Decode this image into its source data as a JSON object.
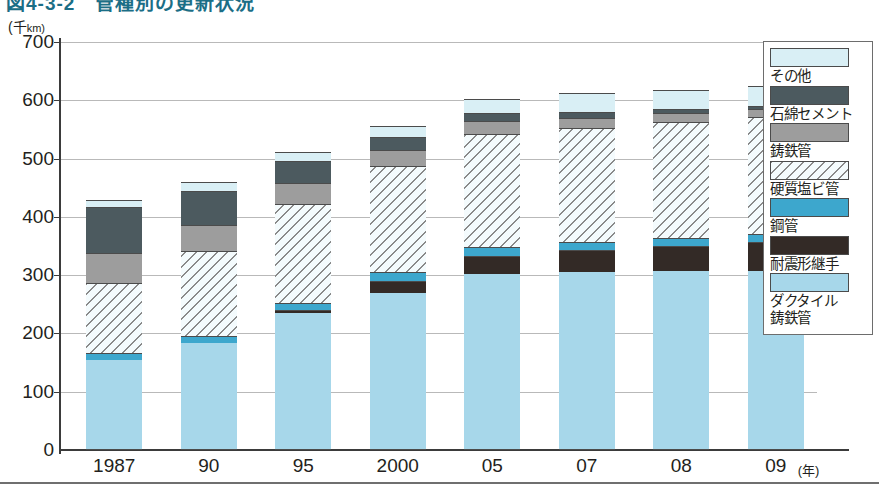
{
  "figure": {
    "title": "図4-3-2　管種別の更新状況",
    "unit_label": "(千km)",
    "unit_main": "(千",
    "unit_small": "km)",
    "x_unit": "(年)"
  },
  "chart_data": {
    "type": "bar",
    "stacked": true,
    "title": "図4-3-2　管種別の更新状況",
    "xlabel": "(年)",
    "ylabel": "(千km)",
    "ylim": [
      0,
      700
    ],
    "yticks": [
      0,
      100,
      200,
      300,
      400,
      500,
      600,
      700
    ],
    "grid": true,
    "legend_position": "right",
    "categories": [
      "1987",
      "90",
      "95",
      "2000",
      "05",
      "07",
      "08",
      "09"
    ],
    "series": [
      {
        "name": "ダクタイル鋳鉄管",
        "color": "#a7d7ea",
        "pattern": "solid",
        "values": [
          152,
          182,
          233,
          268,
          300,
          303,
          305,
          305
        ]
      },
      {
        "name": "耐震形継手",
        "color": "#332a26",
        "pattern": "solid",
        "values": [
          0,
          0,
          5,
          21,
          32,
          38,
          43,
          50
        ]
      },
      {
        "name": "鋼管",
        "color": "#3da7cd",
        "pattern": "solid",
        "values": [
          13,
          12,
          13,
          15,
          14,
          14,
          14,
          14
        ]
      },
      {
        "name": "硬質塩ビ管",
        "color": "#f4fbfd",
        "pattern": "diagonal-hatch",
        "values": [
          120,
          145,
          169,
          181,
          195,
          196,
          199,
          201
        ]
      },
      {
        "name": "鋳鉄管",
        "color": "#9d9d9d",
        "pattern": "solid",
        "values": [
          52,
          46,
          37,
          28,
          22,
          17,
          15,
          13
        ]
      },
      {
        "name": "石綿セメント",
        "color": "#4c5a5f",
        "pattern": "solid",
        "values": [
          78,
          57,
          37,
          22,
          14,
          10,
          8,
          6
        ]
      },
      {
        "name": "その他",
        "color": "#d9eff5",
        "pattern": "solid",
        "values": [
          13,
          16,
          15,
          19,
          23,
          33,
          32,
          33
        ]
      }
    ],
    "totals": [
      428,
      458,
      509,
      554,
      600,
      611,
      616,
      622
    ]
  },
  "yaxis": {
    "ticks": [
      "700",
      "600",
      "500",
      "400",
      "300",
      "200",
      "100",
      "0"
    ]
  },
  "xaxis": {
    "labels": [
      "1987",
      "90",
      "95",
      "2000",
      "05",
      "07",
      "08",
      "09"
    ],
    "unit": "(年)"
  },
  "legend": {
    "items": [
      {
        "label": "その他",
        "swatch": "sw-other"
      },
      {
        "label": "石綿セメント",
        "swatch": "sw-asbes"
      },
      {
        "label": "鋳鉄管",
        "swatch": "sw-cast"
      },
      {
        "label": "硬質塩ビ管",
        "swatch": "sw-pvc"
      },
      {
        "label": "鋼管",
        "swatch": "sw-steel"
      },
      {
        "label": "耐震形継手",
        "swatch": "sw-quake"
      },
      {
        "label": "ダクタイル\n鋳鉄管",
        "swatch": "sw-duct"
      }
    ]
  }
}
